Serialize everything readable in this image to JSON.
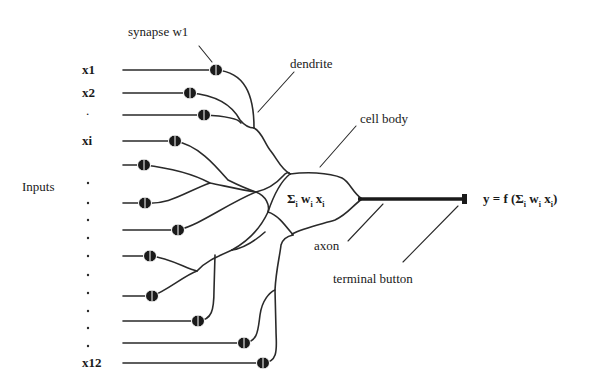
{
  "diagram": {
    "type": "biological-neuron-model",
    "labels": {
      "synapse": "synapse w1",
      "dendrite": "dendrite",
      "cell_body": "cell body",
      "axon": "axon",
      "terminal_button": "terminal button",
      "inputs": "Inputs",
      "sum_expr": {
        "sigma": "Σ",
        "sub_i": "i",
        "w": "w",
        "x": "x"
      },
      "output_expr": {
        "prefix": "y = f (",
        "sigma": "Σ",
        "sub_i": "i",
        "w": "w",
        "x": "x",
        "suffix": ")"
      }
    },
    "input_labels": [
      "x1",
      "x2",
      ".",
      "xi",
      "x12"
    ],
    "input_count": 12,
    "colors": {
      "line": "#2a2a2a",
      "background": "#ffffff",
      "text": "#1a1a1a"
    }
  }
}
